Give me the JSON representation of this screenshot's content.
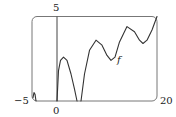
{
  "chart_data": {
    "type": "line",
    "title": "",
    "xlabel": "",
    "ylabel": "",
    "xlim": [
      -5,
      20
    ],
    "ylim": [
      0,
      5
    ],
    "grid": false,
    "legend": null,
    "tick_labels": {
      "x_min": "−5",
      "x_origin": "0",
      "x_max": "20",
      "y_max": "5"
    },
    "annotations": [
      {
        "text": "f",
        "x": 12.2,
        "y": 2.4
      }
    ],
    "series": [
      {
        "name": "f",
        "x": [
          -4.8,
          -4.6,
          -4.4,
          -4.2,
          0,
          0.3,
          0.7,
          1.3,
          2,
          2.8,
          3.5,
          4,
          4.8,
          5.5,
          6.5,
          7.8,
          9,
          10,
          10.8,
          11.6,
          12.5,
          14,
          15.5,
          16.5,
          17.2,
          18,
          19,
          20
        ],
        "y": [
          0.2,
          0.5,
          0.4,
          0,
          0,
          1.8,
          2.4,
          2.6,
          2.4,
          1.6,
          0.7,
          0,
          0,
          1.6,
          3.0,
          3.6,
          3.3,
          2.7,
          2.4,
          2.6,
          3.5,
          4.4,
          4.1,
          3.6,
          3.4,
          3.6,
          4.2,
          5.0
        ]
      }
    ]
  },
  "labels": {
    "y_max": "5",
    "x_min": "−5",
    "x_origin": "0",
    "x_max": "20",
    "curve": "f"
  }
}
